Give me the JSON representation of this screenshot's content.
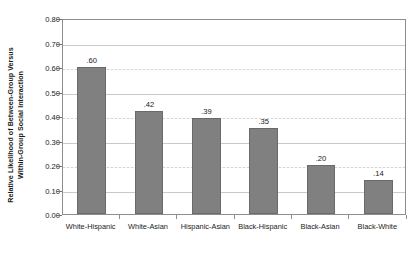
{
  "chart_data": {
    "type": "bar",
    "title": "",
    "subtitle": "",
    "xlabel": "",
    "ylabel": "Relative Likelihood of Between-Group Versus Within-Group Social Interaction",
    "ylabel_line1": "Relative Likelihood of Between-Group Versus",
    "ylabel_line2": "Within-Group Social Interaction",
    "categories": [
      "White-Hispanic",
      "White-Asian",
      "Hispanic-Asian",
      "Black-Hispanic",
      "Black-Asian",
      "Black-White"
    ],
    "values": [
      0.6,
      0.42,
      0.39,
      0.35,
      0.2,
      0.14
    ],
    "value_labels": [
      ".60",
      ".42",
      ".39",
      ".35",
      ".20",
      ".14"
    ],
    "ylim": [
      0.0,
      0.8
    ],
    "ytick_values": [
      0.8,
      0.7,
      0.6,
      0.5,
      0.4,
      0.3,
      0.2,
      0.1,
      0.0
    ],
    "ytick_labels": [
      "0.80",
      "0.70",
      "0.60",
      "0.50",
      "0.40",
      "0.30",
      "0.20",
      "0.10",
      "0.00"
    ],
    "grid": true,
    "grid_axis": "y",
    "legend": false,
    "legend_position": "none",
    "bar_color": "#808080",
    "bar_edge_color": "#6a6a6a",
    "grid_color": "#d4d4d4",
    "axis_color": "#8d8d8d",
    "text_color": "#1a1a1a",
    "background_color": "#ffffff"
  }
}
